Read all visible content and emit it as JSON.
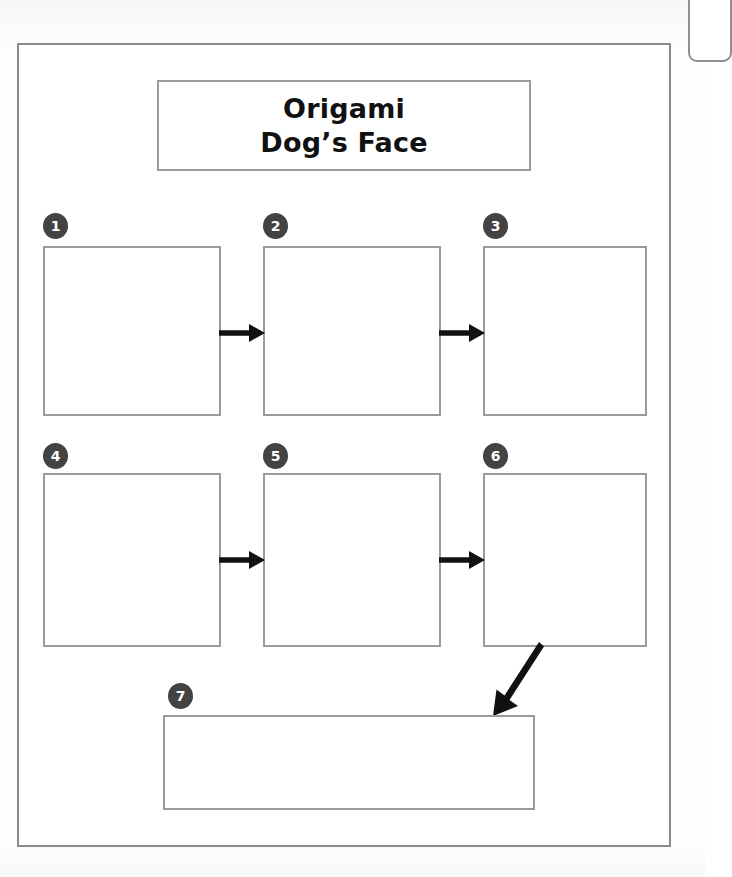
{
  "worksheet": {
    "title": {
      "line1": "Origami",
      "line2": "Dog’s Face"
    },
    "steps": [
      {
        "number": "1",
        "content": ""
      },
      {
        "number": "2",
        "content": ""
      },
      {
        "number": "3",
        "content": ""
      },
      {
        "number": "4",
        "content": ""
      },
      {
        "number": "5",
        "content": ""
      },
      {
        "number": "6",
        "content": ""
      },
      {
        "number": "7",
        "content": ""
      }
    ],
    "colors": {
      "badge_fill": "#434343",
      "badge_text": "#ffffff",
      "box_border": "#9b9b9b",
      "frame_border": "#8a8a8a",
      "arrow": "#111111",
      "page": "#ffffff"
    }
  }
}
